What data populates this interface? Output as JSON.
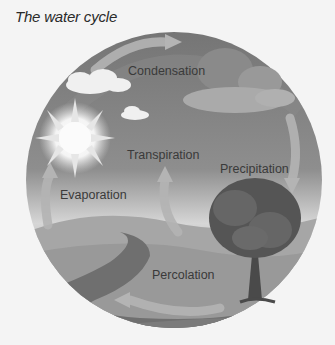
{
  "title": "The water cycle",
  "labels": {
    "condensation": "Condensation",
    "transpiration": "Transpiration",
    "precipitation": "Precipitation",
    "evaporation": "Evaporation",
    "percolation": "Percolation"
  },
  "colors": {
    "background": "#f4f4f4",
    "sky_top": "#7c7c7c",
    "sky_horizon": "#c8c8c8",
    "ground": "#9a9a9a",
    "river": "#6e6e6e",
    "cloud_light": "#f2f2f2",
    "cloud_dark": "#8a8a8a",
    "tree_foliage": "#5a5a5a",
    "trunk": "#4a4a4a",
    "arrow": "#b0b0b0",
    "text": "#3a3a3a"
  }
}
